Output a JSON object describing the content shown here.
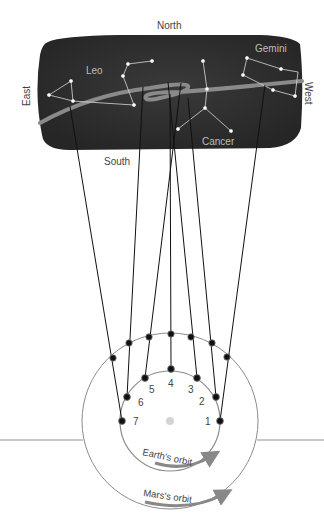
{
  "directions": {
    "north": "North",
    "south": "South",
    "east": "East",
    "west": "West"
  },
  "constellations": {
    "leo": "Leo",
    "cancer": "Cancer",
    "gemini": "Gemini"
  },
  "positions": [
    "1",
    "2",
    "3",
    "4",
    "5",
    "6",
    "7"
  ],
  "orbits": {
    "earth": "Earth's orbit",
    "mars": "Mars's orbit"
  },
  "colors": {
    "sky": "#2e2e2e",
    "path": "#8a8a8a",
    "orbit": "#888888",
    "line": "#111111",
    "sun": "#cfcfcf"
  }
}
